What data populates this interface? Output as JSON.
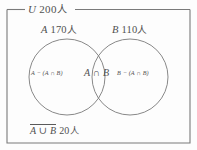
{
  "figure": {
    "type": "venn-diagram",
    "universe": {
      "symbol": "U",
      "count": "200",
      "unit": "人",
      "label": "U 200 人"
    },
    "sets": [
      {
        "symbol": "A",
        "count": "170",
        "unit": "人",
        "label": "A 170 人"
      },
      {
        "symbol": "B",
        "count": "110",
        "unit": "人",
        "label": "B 110 人"
      }
    ],
    "regions": [
      {
        "id": "a-only",
        "label": "A − (A ∩ B)"
      },
      {
        "id": "intersection",
        "label": "A ∩ B"
      },
      {
        "id": "b-only",
        "label": "B − (A ∩ B)"
      }
    ],
    "complement": {
      "expression": "A ∪ B",
      "count": "20",
      "unit": "人",
      "suffix": " 20 人"
    },
    "colors": {
      "background": "#fdfdfd",
      "stroke": "#6b6b6b",
      "text": "#505050"
    }
  }
}
